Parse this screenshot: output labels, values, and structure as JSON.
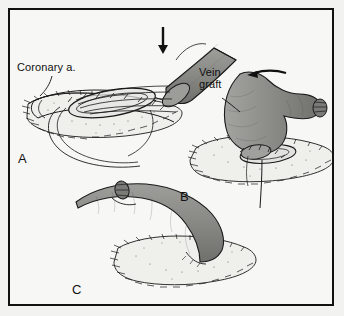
{
  "figure": {
    "border_color": "#111111",
    "background_color": "#f7f7f5",
    "ink_color": "#111111",
    "vessel_fill_color": "#8a8a8a",
    "vessel_fill_light": "#a8a8a6",
    "lumen_fill_color": "#e8e8e6",
    "myocardium_fill_color": "#efefec"
  },
  "labels": {
    "coronary_artery": "Coronary a.",
    "vein_graft": "Vein\ngraft"
  },
  "panels": [
    {
      "letter": "A",
      "description": "Vein graft end sutured to arteriotomy with parachute technique"
    },
    {
      "letter": "B",
      "description": "Graft lowered onto coronary artery, suture tail trailing"
    },
    {
      "letter": "C",
      "description": "Completed anastomosis, graft seated on myocardium"
    }
  ],
  "arrows": [
    {
      "name": "down-arrow-panel-a",
      "direction": "down"
    },
    {
      "name": "left-arrow-panel-b",
      "direction": "left"
    }
  ]
}
